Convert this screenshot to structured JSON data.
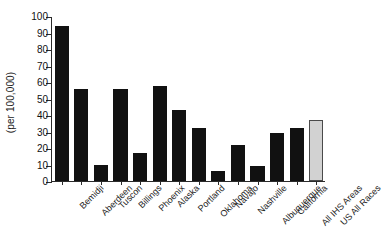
{
  "chart_data": {
    "type": "bar",
    "title": "",
    "subtitle": "",
    "xlabel": "",
    "ylabel": "(per 100,000)",
    "ylim": [
      0,
      100
    ],
    "ytick_step": 10,
    "yticks": [
      0,
      10,
      20,
      30,
      40,
      50,
      60,
      70,
      80,
      90,
      100
    ],
    "ytick_labels": [
      "0",
      "10",
      "20",
      "30",
      "40",
      "50",
      "60",
      "70",
      "80",
      "90",
      "100"
    ],
    "grid": false,
    "legend": false,
    "legend_position": "none",
    "categories": [
      "Bemidji",
      "Aberdeen",
      "Tuscon",
      "Billings",
      "Phoenix",
      "Alaska",
      "Portland",
      "Oklahoma",
      "Navajo",
      "Nashville",
      "Albuquerque",
      "California",
      "All IHS Areas",
      "US All Races"
    ],
    "values": [
      94,
      55.5,
      9.7,
      55.5,
      17,
      57.5,
      43,
      32,
      6,
      22,
      9,
      29,
      32,
      37
    ],
    "bar_colors": [
      "#111111",
      "#111111",
      "#111111",
      "#111111",
      "#111111",
      "#111111",
      "#111111",
      "#111111",
      "#111111",
      "#111111",
      "#111111",
      "#111111",
      "#111111",
      "#d2d2d2"
    ],
    "highlight_index": 13,
    "highlight_color": "#d2d2d2",
    "primary_color": "#111111",
    "axis_color": "#2b2b2b"
  }
}
